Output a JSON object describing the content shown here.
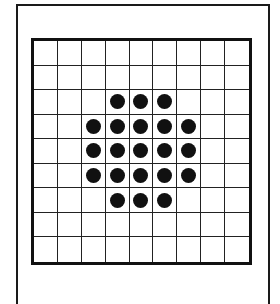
{
  "figure": {
    "type": "dot-grid",
    "rows": 9,
    "cols": 9,
    "dot_color": "#111111",
    "line_color": "#222222",
    "dots": [
      [
        2,
        3
      ],
      [
        2,
        4
      ],
      [
        2,
        5
      ],
      [
        3,
        2
      ],
      [
        3,
        3
      ],
      [
        3,
        4
      ],
      [
        3,
        5
      ],
      [
        3,
        6
      ],
      [
        4,
        2
      ],
      [
        4,
        3
      ],
      [
        4,
        4
      ],
      [
        4,
        5
      ],
      [
        4,
        6
      ],
      [
        5,
        2
      ],
      [
        5,
        3
      ],
      [
        5,
        4
      ],
      [
        5,
        5
      ],
      [
        5,
        6
      ],
      [
        6,
        3
      ],
      [
        6,
        4
      ],
      [
        6,
        5
      ]
    ],
    "dot_count": 21
  }
}
